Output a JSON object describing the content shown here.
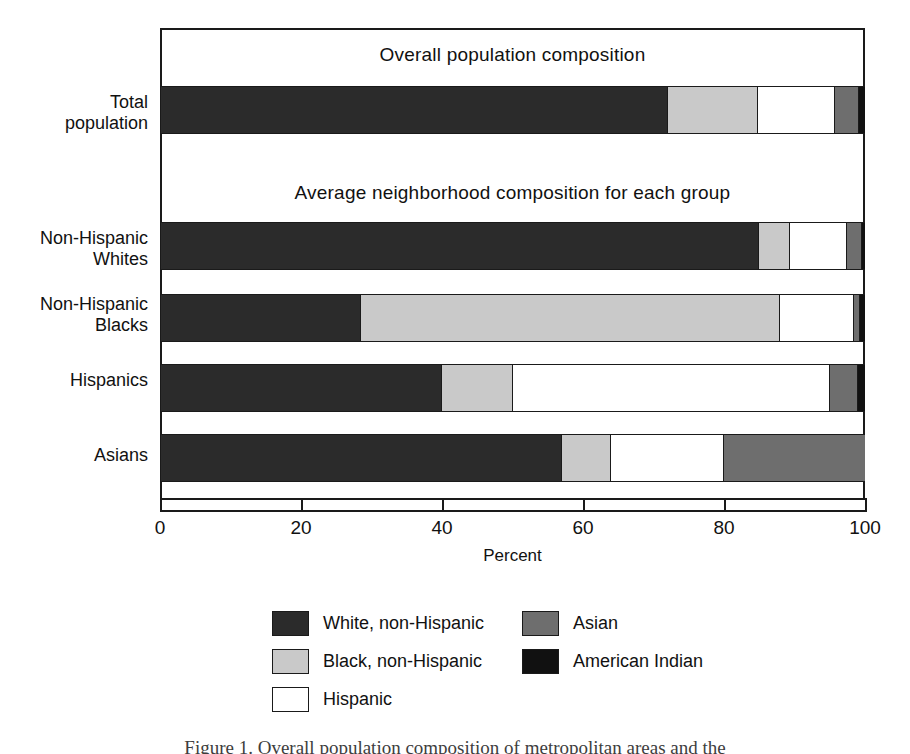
{
  "chart_data": {
    "type": "bar",
    "orientation": "horizontal",
    "stacked": true,
    "title": "",
    "panel_titles": {
      "overall": "Overall population composition",
      "average": "Average neighborhood composition for each group"
    },
    "xlabel": "Percent",
    "ylabel": "",
    "xlim": [
      0,
      100
    ],
    "xticks": [
      0,
      20,
      40,
      60,
      80,
      100
    ],
    "xtick_labels": [
      "0",
      "20",
      "40",
      "60",
      "80",
      "100"
    ],
    "grid": false,
    "legend_position": "bottom",
    "categories": [
      "Total population",
      "Non-Hispanic Whites",
      "Non-Hispanic Blacks",
      "Hispanics",
      "Asians"
    ],
    "category_labels": [
      [
        "Total",
        "population"
      ],
      [
        "Non-Hispanic",
        "Whites"
      ],
      [
        "Non-Hispanic",
        "Blacks"
      ],
      [
        "Hispanics"
      ],
      [
        "Asians"
      ]
    ],
    "series": [
      {
        "name": "White, non-Hispanic",
        "color": "#2b2b2b",
        "values": [
          72.0,
          85.0,
          28.5,
          40.0,
          57.0
        ]
      },
      {
        "name": "Black, non-Hispanic",
        "color": "#c9c9c9",
        "values": [
          12.8,
          4.4,
          59.5,
          10.0,
          7.0
        ]
      },
      {
        "name": "Hispanic",
        "color": "#ffffff",
        "values": [
          11.0,
          8.0,
          10.5,
          45.0,
          16.0
        ]
      },
      {
        "name": "Asian",
        "color": "#6e6e6e",
        "values": [
          3.4,
          2.2,
          0.8,
          4.0,
          20.0
        ]
      },
      {
        "name": "American Indian",
        "color": "#111111",
        "values": [
          0.8,
          0.4,
          0.7,
          1.0,
          0.0
        ]
      }
    ],
    "legend_entries": [
      {
        "label": "White, non-Hispanic",
        "color": "#2b2b2b"
      },
      {
        "label": "Asian",
        "color": "#6e6e6e"
      },
      {
        "label": "Black, non-Hispanic",
        "color": "#c9c9c9"
      },
      {
        "label": "American Indian",
        "color": "#111111"
      },
      {
        "label": "Hispanic",
        "color": "#ffffff"
      }
    ]
  },
  "caption": "Figure 1. Overall population composition of metropolitan areas and the"
}
